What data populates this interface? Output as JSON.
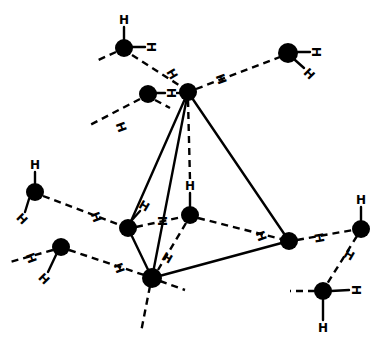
{
  "diagram": {
    "type": "molecular-structure",
    "colors": {
      "ink": "#000000",
      "background": "#ffffff"
    },
    "h_label": "H",
    "atoms": [
      {
        "id": "apex",
        "x": 188,
        "y": 92,
        "r": 9
      },
      {
        "id": "vleft",
        "x": 128,
        "y": 228,
        "r": 9
      },
      {
        "id": "vcenter",
        "x": 190,
        "y": 215,
        "r": 9
      },
      {
        "id": "vright",
        "x": 289,
        "y": 241,
        "r": 9
      },
      {
        "id": "vbottom",
        "x": 152,
        "y": 278,
        "r": 10
      },
      {
        "id": "w1",
        "x": 124,
        "y": 48,
        "r": 9
      },
      {
        "id": "w2",
        "x": 148,
        "y": 94,
        "r": 9
      },
      {
        "id": "w3",
        "x": 288,
        "y": 53,
        "r": 10
      },
      {
        "id": "w4",
        "x": 35,
        "y": 192,
        "r": 9
      },
      {
        "id": "w5",
        "x": 61,
        "y": 247,
        "r": 9
      },
      {
        "id": "w6",
        "x": 361,
        "y": 229,
        "r": 9
      },
      {
        "id": "w7",
        "x": 323,
        "y": 291,
        "r": 9
      }
    ],
    "h_labels": [
      {
        "x": 124,
        "y": 20,
        "rot": 0
      },
      {
        "x": 151,
        "y": 47,
        "rot": 90
      },
      {
        "x": 172,
        "y": 73,
        "rot": 60
      },
      {
        "x": 170,
        "y": 94,
        "rot": 90
      },
      {
        "x": 218,
        "y": 80,
        "rot": 70
      },
      {
        "x": 121,
        "y": 126,
        "rot": 70
      },
      {
        "x": 316,
        "y": 53,
        "rot": 90
      },
      {
        "x": 309,
        "y": 74,
        "rot": 45
      },
      {
        "x": 35,
        "y": 166,
        "rot": 0
      },
      {
        "x": 22,
        "y": 219,
        "rot": 45
      },
      {
        "x": 95,
        "y": 218,
        "rot": 70
      },
      {
        "x": 143,
        "y": 206,
        "rot": 30
      },
      {
        "x": 190,
        "y": 187,
        "rot": 0
      },
      {
        "x": 162,
        "y": 222,
        "rot": 90
      },
      {
        "x": 30,
        "y": 258,
        "rot": 70
      },
      {
        "x": 44,
        "y": 279,
        "rot": 45
      },
      {
        "x": 118,
        "y": 268,
        "rot": 70
      },
      {
        "x": 168,
        "y": 258,
        "rot": 30
      },
      {
        "x": 260,
        "y": 236,
        "rot": 70
      },
      {
        "x": 318,
        "y": 239,
        "rot": 70
      },
      {
        "x": 361,
        "y": 200,
        "rot": 0
      },
      {
        "x": 349,
        "y": 256,
        "rot": 30
      },
      {
        "x": 355,
        "y": 290,
        "rot": 90
      },
      {
        "x": 323,
        "y": 328,
        "rot": 0
      }
    ]
  }
}
